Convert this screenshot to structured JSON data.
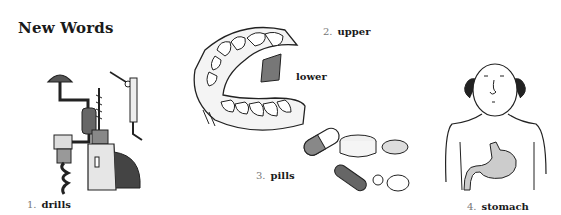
{
  "heading": "New Words",
  "items": [
    {
      "number": "1.",
      "word": "drills",
      "illustration": "drills-illustration"
    },
    {
      "number": "2.",
      "word": "upper",
      "secondary_word": "lower",
      "illustration": "teeth-illustration"
    },
    {
      "number": "3.",
      "word": "pills",
      "illustration": "pills-illustration"
    },
    {
      "number": "4.",
      "word": "stomach",
      "illustration": "stomach-illustration"
    }
  ]
}
